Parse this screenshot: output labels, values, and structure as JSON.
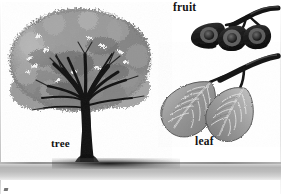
{
  "plate": {
    "title": "Botanical identification plate",
    "subject": "elm",
    "palette": {
      "background": "#ffffff",
      "ink": "#121212",
      "foliage_mid": "#8e8e8e",
      "foliage_dark": "#5a5a5a",
      "foliage_light": "#c8c8c8",
      "trunk": "#121212",
      "ground": "#b4b4b4",
      "leaf_mid": "#9a9a9a",
      "fruit_dark": "#1c1c1c"
    },
    "labels": [
      {
        "id": "tree",
        "text": "tree",
        "x": 51,
        "y": 138
      },
      {
        "id": "leaf",
        "text": "leaf",
        "x": 195,
        "y": 136
      },
      {
        "id": "fruit",
        "text": "fruit",
        "x": 173,
        "y": 2
      }
    ],
    "figures": [
      {
        "id": "tree-figure",
        "name": "whole tree with vase-shaped crown",
        "label": "tree"
      },
      {
        "id": "fruit-figure",
        "name": "cluster of three winged fruits on a twig",
        "label": "fruit",
        "count": 3
      },
      {
        "id": "leaf-figure",
        "name": "two serrated leaves on a twig",
        "label": "leaf",
        "count": 2
      }
    ],
    "ground": {
      "name": "ground line with cast shadow"
    }
  }
}
